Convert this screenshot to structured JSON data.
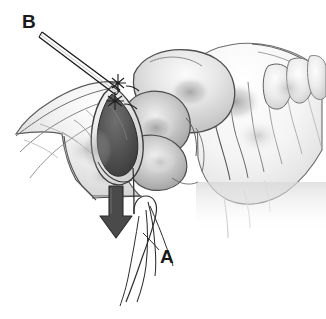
{
  "figure": {
    "medium": "grayscale pencil medical illustration",
    "background_color": "#ffffff",
    "ink_color": "#1a1a1a",
    "width": 326,
    "height": 319
  },
  "labels": [
    {
      "id": "label-a",
      "text": "A",
      "position": {
        "x": 160,
        "y": 247
      },
      "refers_to": "suture strands held at lower right",
      "color": "#1a1a1a"
    },
    {
      "id": "label-b",
      "text": "B",
      "position": {
        "x": 22,
        "y": 12
      },
      "refers_to": "needle / instrument entering tissue at upper left",
      "color": "#1a1a1a"
    }
  ],
  "annotations": {
    "traction_arrow": {
      "name": "downward traction arrow",
      "direction": "down",
      "color": "#3b3b3b",
      "tip": {
        "x": 116,
        "y": 236
      },
      "tail": {
        "x": 116,
        "y": 186
      }
    },
    "leader_lines": [
      {
        "name": "needle-leader-line-b",
        "from": {
          "x": 42,
          "y": 33
        },
        "to": {
          "x": 112,
          "y": 85
        }
      },
      {
        "name": "suture-leader-line-a",
        "from": {
          "x": 158,
          "y": 250
        },
        "to": {
          "x": 143,
          "y": 232
        }
      }
    ]
  },
  "anatomy": {
    "structures": [
      {
        "name": "retracted-tissue-flap-left",
        "tone": "light-gray"
      },
      {
        "name": "incision-cavity",
        "tone": "dark-gray"
      },
      {
        "name": "organ-lobes-center",
        "tone": "mid-gray"
      },
      {
        "name": "tissue-folds-right",
        "tone": "very-light-gray"
      }
    ]
  },
  "instruments": {
    "needle": {
      "name": "suture-needle",
      "label": "B"
    },
    "suture_strands": {
      "name": "suture-strands",
      "label": "A",
      "count": 4
    }
  }
}
